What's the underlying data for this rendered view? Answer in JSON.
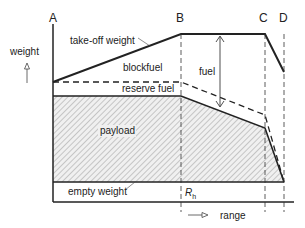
{
  "diagram": {
    "points": {
      "A": "A",
      "B": "B",
      "C": "C",
      "D": "D"
    },
    "y_axis_label": "weight",
    "x_axis_label": "range",
    "regions": {
      "takeoff": "take-off weight",
      "blockfuel": "blockfuel",
      "fuel": "fuel",
      "reserve": "reserve fuel",
      "payload": "payload",
      "empty": "empty weight"
    },
    "range_marker": "R",
    "range_marker_sub": "h",
    "colors": {
      "line": "#222222",
      "hatch": "#9a9a9a",
      "payload_fill": "#e8e8e8",
      "background": "#ffffff"
    }
  }
}
